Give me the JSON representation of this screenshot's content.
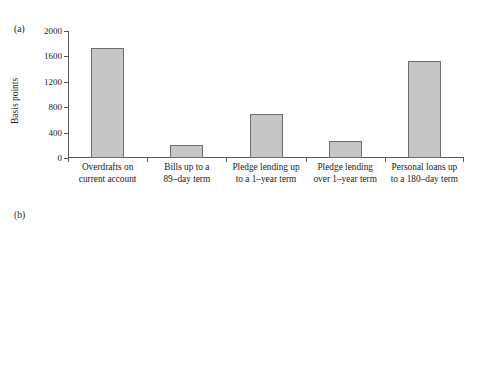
{
  "figure": {
    "background": "#ffffff",
    "bar_fill": "#c6c6c6",
    "bar_stroke": "#6e6e6e",
    "axis_color": "#555555"
  },
  "panels": {
    "a": {
      "tag": "(a)"
    },
    "b": {
      "tag": "(b)"
    }
  },
  "chart_data": [
    {
      "type": "bar",
      "panel": "(a)",
      "title": "",
      "xlabel": "",
      "ylabel": "Basis points",
      "ylim": [
        0,
        2000
      ],
      "yticks": [
        0,
        400,
        800,
        1200,
        1600,
        2000
      ],
      "ytick_labels": [
        "0",
        "400",
        "800",
        "1200",
        "1600",
        "2000"
      ],
      "grid": false,
      "legend": "none",
      "categories": [
        "Overdrafts on current account",
        "Bills up to a 89-day term",
        "Pledge lending up to a 1-year term",
        "Pledge lending over 1-year term",
        "Personal loans up to a 180-day term"
      ],
      "category_lines": [
        [
          "Overdrafts on",
          "current account"
        ],
        [
          "Bills up to a",
          "89–day term"
        ],
        [
          "Pledge lending up",
          "to a 1–year term"
        ],
        [
          "Pledge lending",
          "over 1–year term"
        ],
        [
          "Personal loans up",
          "to a 180–day term"
        ]
      ],
      "values": [
        1730,
        200,
        700,
        270,
        1520
      ]
    },
    {
      "type": "bar",
      "panel": "(b)",
      "title": "",
      "xlabel": "",
      "ylabel": "Risk indicator spread",
      "ylim": [
        -0.2,
        1.0
      ],
      "yticks": [
        -0.2,
        0.0,
        0.2,
        0.4,
        0.6,
        0.8,
        1.0
      ],
      "ytick_labels": [
        "-0.20",
        "0.00",
        "0.20",
        "0.40",
        "0.60",
        "0.80",
        "1.00"
      ],
      "grid": false,
      "legend": "none",
      "categories": [
        "Overdrafts on current account",
        "Bills up to a 89-day term",
        "Pledge lending up to a 1-year term",
        "Pledge lending over 1-year term",
        "Personal loans up to a 180-day term"
      ],
      "category_lines": [
        [
          "Overdrafts on",
          "current account"
        ],
        [
          "Bills up to a",
          "89–day term"
        ],
        [
          "Pledge lending up",
          "to a 1–year term"
        ],
        [
          "Pledge lending",
          "over 1–year term"
        ],
        [
          "Personal loans up",
          "to a 180–day term"
        ]
      ],
      "values": [
        0.86,
        0.0,
        0.18,
        -0.14,
        0.67
      ]
    }
  ]
}
